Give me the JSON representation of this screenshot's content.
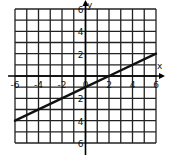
{
  "chart_data": {
    "type": "line",
    "title": "",
    "xlabel": "x",
    "ylabel": "y",
    "xlim": [
      -6,
      6
    ],
    "ylim": [
      -6,
      6
    ],
    "grid": true,
    "grid_step": 1,
    "x_tick_labels": [
      "-6",
      "-4",
      "-2",
      "0",
      "2",
      "4",
      "6"
    ],
    "y_tick_labels": [
      "6",
      "4",
      "2",
      "2",
      "4",
      "6"
    ],
    "y_tick_values": [
      6,
      4,
      2,
      -2,
      -4,
      -6
    ],
    "series": [
      {
        "name": "y = 0.5x - 1",
        "slope": 0.5,
        "intercept": -1,
        "x": [
          -6,
          0,
          2,
          6
        ],
        "y": [
          -4,
          -1,
          0,
          2
        ]
      }
    ]
  },
  "colors": {
    "grid": "#222222",
    "line": "#111111",
    "background": "#ffffff"
  }
}
